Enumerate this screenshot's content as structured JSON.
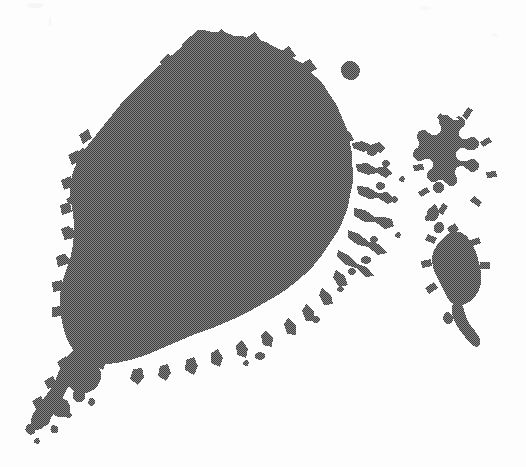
{
  "figure": {
    "domain": "Natural-Image",
    "canvas": {
      "width": 526,
      "height": 467
    },
    "colors": {
      "background": "#fdfdfd",
      "paper": "#ffffff",
      "cluster_fill": "#5a5a5a",
      "cluster_dither_dark": "#3c3c3c",
      "cluster_dither_light": "#8a8a8a",
      "cluster_edge": "#4e4e4e"
    },
    "render": {
      "halftone": "checkerboard-dither",
      "dither_cell_px": 2,
      "mean_gray_level": "#5a5a5a",
      "edge_style": "rough-fractal",
      "antialias": "nearest"
    },
    "components": [
      {
        "id": "main-cluster",
        "name": "main-cluster",
        "label": "Main aggregation cluster",
        "bbox": [
          58,
          30,
          400,
          345
        ],
        "area_fraction": 0.62,
        "notes": "Dense core with ragged dendritic perimeter; densest between x=120..300, y=80..300."
      },
      {
        "id": "southwest-peninsula",
        "name": "southwest-peninsula",
        "label": "Southwest peninsula",
        "bbox": [
          30,
          330,
          180,
          420
        ],
        "area_fraction": 0.07,
        "notes": "Lobe extending down-left from the main body, narrowing into separate fragments."
      },
      {
        "id": "southwest-archipelago",
        "name": "southwest-archipelago",
        "label": "Southwest archipelago fragments",
        "bbox": [
          22,
          378,
          120,
          448
        ],
        "area_fraction": 0.02,
        "notes": "Chain of small disconnected islands trailing to the lower-left corner."
      },
      {
        "id": "north-speck",
        "name": "north-speck-island",
        "label": "Detached northern speck",
        "bbox": [
          340,
          58,
          366,
          82
        ],
        "area_fraction": 0.002,
        "notes": "Small isolated blob above and right of the main cluster."
      },
      {
        "id": "east-dendrite-cluster",
        "name": "east-dendrite-cluster",
        "label": "Eastern dendritic cluster",
        "bbox": [
          412,
          115,
          500,
          215
        ],
        "area_fraction": 0.03,
        "notes": "Branching, tree-like arms; low density, high perimeter."
      },
      {
        "id": "east-island",
        "name": "east-solid-island",
        "label": "Eastern solid island with tail",
        "bbox": [
          418,
          228,
          500,
          330
        ],
        "area_fraction": 0.04,
        "notes": "Compact solid mass with a narrow tail running to the lower right."
      },
      {
        "id": "east-filaments",
        "name": "east-connecting-filaments",
        "label": "Filaments between eastern clusters",
        "bbox": [
          420,
          200,
          470,
          240
        ],
        "area_fraction": 0.004,
        "notes": "Thin broken strands linking the dendritic cluster to the solid island."
      },
      {
        "id": "east-fringe-specks",
        "name": "east-fringe-specks",
        "label": "Eastern fringe specks of main cluster",
        "bbox": [
          330,
          140,
          405,
          265
        ],
        "area_fraction": 0.006,
        "notes": "Isolated dots and short dendrite tips scattered off the main cluster's right edge."
      }
    ]
  }
}
